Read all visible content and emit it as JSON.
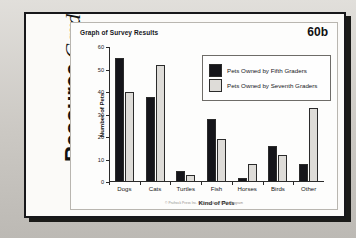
{
  "card": {
    "spine_word1": "Resource",
    "spine_word2": "Card",
    "page_number": "60b",
    "footer": "© Prufrock Press Inc. • Intermediate Study Program"
  },
  "chart_data": {
    "type": "bar",
    "title": "Graph of Survey Results",
    "xlabel": "Kind of Pets",
    "ylabel": "Number of Pets",
    "ylim": [
      0,
      60
    ],
    "yticks": [
      0,
      10,
      20,
      30,
      40,
      50,
      60
    ],
    "grid": false,
    "legend_position": "upper-right-inside",
    "categories": [
      "Dogs",
      "Cats",
      "Turtles",
      "Fish",
      "Horses",
      "Birds",
      "Other"
    ],
    "series": [
      {
        "name": "Pets Owned by Fifth Graders",
        "color": "#15151a",
        "values": [
          55,
          38,
          5,
          28,
          2,
          16,
          8
        ]
      },
      {
        "name": "Pets Owned by Seventh Graders",
        "color": "#dedcd8",
        "values": [
          40,
          52,
          3,
          19,
          8,
          12,
          33
        ]
      }
    ]
  }
}
